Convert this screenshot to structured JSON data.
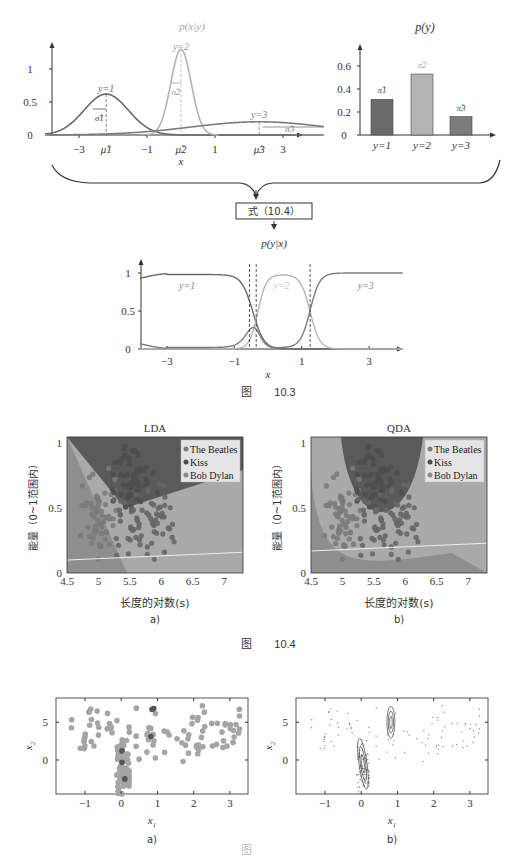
{
  "figure_10_3": {
    "caption_prefix": "图",
    "caption_number": "10.3",
    "class_conditional": {
      "title": "p(x|y)",
      "xlabel": "x",
      "yticks": [
        "0",
        "0.5",
        "1"
      ],
      "xticks": [
        "−3",
        "−1",
        "1",
        "3"
      ],
      "mu_labels": [
        "μ̂1",
        "μ̂2",
        "μ̂3"
      ],
      "sigma_labels": [
        "σ̂1",
        "σ̂2",
        "σ̂3"
      ],
      "curve_labels": [
        "y=1",
        "y=2",
        "y=3"
      ]
    },
    "prior": {
      "title": "p(y)",
      "yticks": [
        "0",
        "0.2",
        "0.4",
        "0.6"
      ],
      "categories": [
        "y=1",
        "y=2",
        "y=3"
      ],
      "bar_labels": [
        "π̂1",
        "π̂2",
        "π̂3"
      ]
    },
    "formula_box": "式（10.4）",
    "posterior": {
      "title": "p(y|x)",
      "xlabel": "x",
      "yticks": [
        "0",
        "0.5",
        "1"
      ],
      "xticks": [
        "−3",
        "−1",
        "1",
        "3"
      ],
      "curve_labels": [
        "y=1",
        "y=2",
        "y=3"
      ]
    }
  },
  "figure_10_4": {
    "caption_prefix": "图",
    "caption_number": "10.4",
    "panels": [
      {
        "title": "LDA",
        "sub": "a)"
      },
      {
        "title": "QDA",
        "sub": "b)"
      }
    ],
    "ylabel": "能量（0~1范围内）",
    "xlabel": "长度的对数(s)",
    "xticks": [
      "4.5",
      "5",
      "5.5",
      "6",
      "6.5",
      "7"
    ],
    "yticks": [
      "0",
      "0.5",
      "1"
    ],
    "legend": [
      "The Beatles",
      "Kiss",
      "Bob Dylan"
    ]
  },
  "figure_10_5": {
    "panels": [
      {
        "sub": "a)"
      },
      {
        "sub": "b)"
      }
    ],
    "xlabel": "x1",
    "ylabel": "x2",
    "xticks": [
      "−1",
      "0",
      "1",
      "2",
      "3"
    ],
    "yticks": [
      "0",
      "5"
    ]
  },
  "colors": {
    "class1": "#6a6a6a",
    "class2": "#b4b4b4",
    "class3": "#7c7c7c",
    "kiss_region": "#5a5a5a",
    "beatles_region": "#a9a9a9",
    "dylan_region": "#8e8e8e"
  },
  "chart_data": [
    {
      "type": "line",
      "title": "p(x|y)",
      "xlabel": "x",
      "ylabel": "",
      "xlim": [
        -4,
        4.5
      ],
      "ylim": [
        0,
        1.3
      ],
      "series": [
        {
          "name": "y=1",
          "mu": -2.2,
          "sigma": 0.65,
          "peak": 0.62
        },
        {
          "name": "y=2",
          "mu": 0.0,
          "sigma": 0.3,
          "peak": 1.3
        },
        {
          "name": "y=3",
          "mu": 2.3,
          "sigma": 2.0,
          "peak": 0.2
        }
      ]
    },
    {
      "type": "bar",
      "title": "p(y)",
      "categories": [
        "y=1",
        "y=2",
        "y=3"
      ],
      "values": [
        0.31,
        0.53,
        0.16
      ],
      "ylim": [
        0,
        0.7
      ]
    },
    {
      "type": "line",
      "title": "p(y|x)",
      "xlabel": "x",
      "xlim": [
        -3.8,
        4.0
      ],
      "ylim": [
        0,
        1
      ],
      "series": [
        {
          "name": "y=1",
          "description": "≈0.9 at x=-3.8, ≈1 on [-3,-1.5], falls to ~0 by x≈0.5"
        },
        {
          "name": "y=2",
          "description": "≈0 left, rises near x≈-0.3 to ~0.97 on [0,1], falls to ~0 by x≈1.7"
        },
        {
          "name": "y=3",
          "description": "≈0.1 at x=-3.8, ~0 mid, small bump ~0.45 near x=-0.5, rises near x=1.2 to 1"
        }
      ],
      "decision_boundaries": [
        -0.55,
        -0.35,
        1.25
      ]
    },
    {
      "type": "scatter",
      "title": "LDA",
      "xlabel": "长度的对数(s)",
      "ylabel": "能量（0~1范围内）",
      "xlim": [
        4.5,
        7.3
      ],
      "ylim": [
        0,
        1.05
      ],
      "legend": [
        "The Beatles",
        "Kiss",
        "Bob Dylan"
      ],
      "legend_position": "upper right"
    },
    {
      "type": "scatter",
      "title": "QDA",
      "xlabel": "长度的对数(s)",
      "ylabel": "能量（0~1范围内）",
      "xlim": [
        4.5,
        7.3
      ],
      "ylim": [
        0,
        1.05
      ],
      "legend": [
        "The Beatles",
        "Kiss",
        "Bob Dylan"
      ],
      "legend_position": "upper right"
    },
    {
      "type": "scatter",
      "xlabel": "x1",
      "ylabel": "x2",
      "xlim": [
        -1.8,
        3.5
      ],
      "ylim": [
        -4.5,
        8.2
      ]
    },
    {
      "type": "scatter",
      "xlabel": "x1",
      "ylabel": "x2",
      "xlim": [
        -1.8,
        3.5
      ],
      "ylim": [
        -4.5,
        8.2
      ],
      "overlay": "density contours near (0,0) and (0.8,5)"
    }
  ]
}
